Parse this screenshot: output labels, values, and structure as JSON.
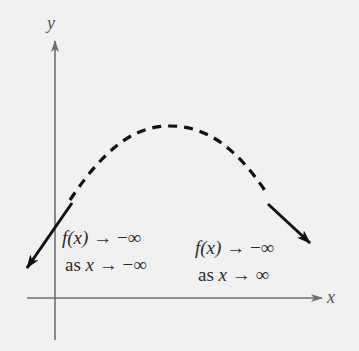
{
  "axes": {
    "x_label": "x",
    "y_label": "y"
  },
  "curve": {
    "shape": "downward-opening parabola",
    "style_ends": "solid with arrowheads",
    "style_middle": "dashed"
  },
  "annotations": {
    "left": {
      "line1_func": "f(x)",
      "line1_rest": " → −∞",
      "line2_as": "as ",
      "line2_var": "x",
      "line2_rest": " → −∞"
    },
    "right": {
      "line1_func": "f(x)",
      "line1_rest": " → −∞",
      "line2_as": "as ",
      "line2_var": "x",
      "line2_rest": " → ∞"
    }
  },
  "colors": {
    "background": "#f1f1f1",
    "axis": "#6e6e6e",
    "curve": "#111111",
    "text": "#2b2b2b"
  }
}
